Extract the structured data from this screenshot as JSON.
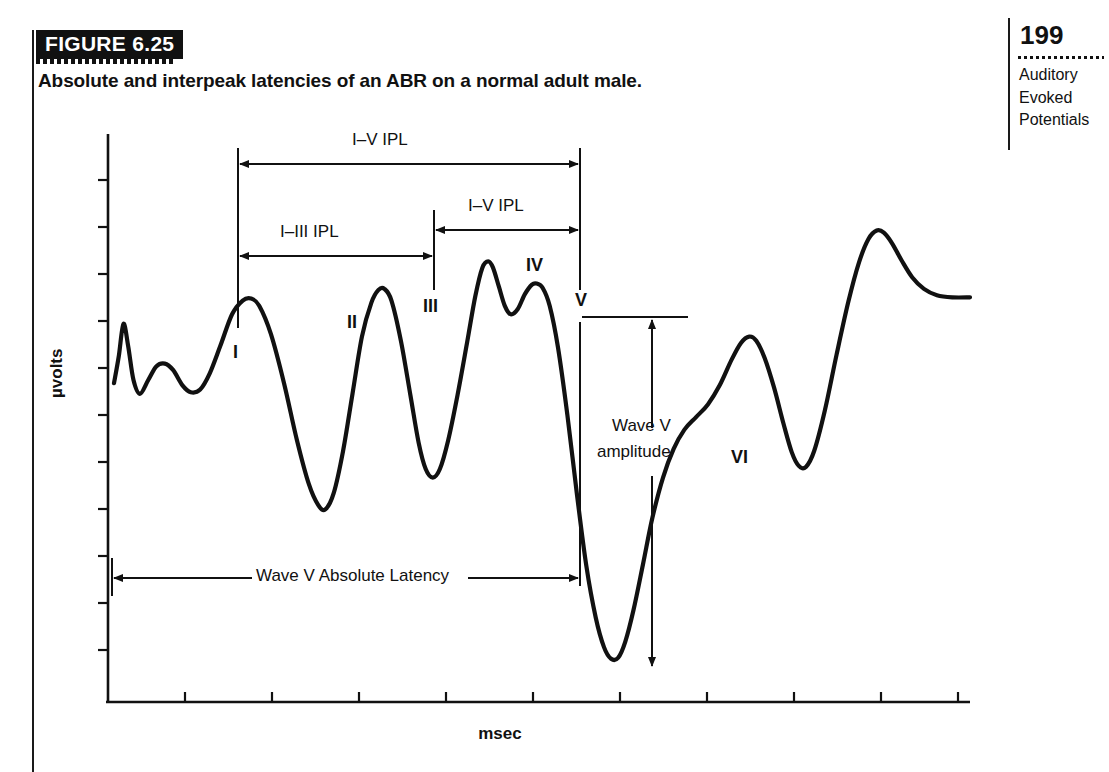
{
  "figure": {
    "tag": "FIGURE 6.25",
    "caption": "Absolute and interpeak latencies of an ABR on a normal adult male."
  },
  "margin": {
    "page_number": "199",
    "running_head_lines": [
      "Auditory",
      "Evoked",
      "Potentials"
    ]
  },
  "chart_data": {
    "type": "line",
    "title": "Absolute and interpeak latencies of an ABR on a normal adult male.",
    "xlabel": "msec",
    "ylabel": "µvolts",
    "grid": false,
    "legend": "none",
    "x_tick_count": 10,
    "x_tick_labels": [],
    "y_tick_count": 12,
    "y_tick_labels": [],
    "peak_labels": [
      "I",
      "II",
      "III",
      "IV",
      "V",
      "VI"
    ],
    "annotations": [
      {
        "id": "ipl-i-v-top",
        "label": "I–V IPL",
        "from_peak": "I",
        "to_peak": "V",
        "style": "double-arrow"
      },
      {
        "id": "ipl-iv-v",
        "label": "I–V IPL",
        "from_peak": "III",
        "to_peak": "V",
        "style": "double-arrow"
      },
      {
        "id": "ipl-i-iii",
        "label": "I–III IPL",
        "from_peak": "I",
        "to_peak": "III",
        "style": "double-arrow"
      },
      {
        "id": "wave-v-amplitude",
        "label_line1": "Wave V",
        "label_line2": "amplitude",
        "style": "vertical-double-arrow"
      },
      {
        "id": "wave-v-absolute-latency",
        "label": "Wave V Absolute Latency",
        "style": "double-arrow-with-inline-label"
      }
    ],
    "series": [
      {
        "name": "ABR waveform",
        "comment": "normalized trace: x in 0..1 across plotting area, y in 0..1 where 1 = top of plot",
        "points": [
          [
            0.0,
            0.56
          ],
          [
            0.008,
            0.61
          ],
          [
            0.016,
            0.672
          ],
          [
            0.024,
            0.63
          ],
          [
            0.033,
            0.566
          ],
          [
            0.044,
            0.54
          ],
          [
            0.058,
            0.566
          ],
          [
            0.072,
            0.592
          ],
          [
            0.086,
            0.597
          ],
          [
            0.1,
            0.585
          ],
          [
            0.116,
            0.556
          ],
          [
            0.13,
            0.543
          ],
          [
            0.146,
            0.548
          ],
          [
            0.162,
            0.578
          ],
          [
            0.18,
            0.63
          ],
          [
            0.2,
            0.69
          ],
          [
            0.218,
            0.716
          ],
          [
            0.232,
            0.72
          ],
          [
            0.246,
            0.706
          ],
          [
            0.266,
            0.652
          ],
          [
            0.288,
            0.56
          ],
          [
            0.31,
            0.452
          ],
          [
            0.33,
            0.37
          ],
          [
            0.346,
            0.33
          ],
          [
            0.358,
            0.322
          ],
          [
            0.372,
            0.352
          ],
          [
            0.388,
            0.432
          ],
          [
            0.404,
            0.54
          ],
          [
            0.42,
            0.648
          ],
          [
            0.436,
            0.712
          ],
          [
            0.448,
            0.736
          ],
          [
            0.458,
            0.738
          ],
          [
            0.47,
            0.716
          ],
          [
            0.486,
            0.64
          ],
          [
            0.502,
            0.538
          ],
          [
            0.516,
            0.448
          ],
          [
            0.528,
            0.398
          ],
          [
            0.54,
            0.382
          ],
          [
            0.552,
            0.398
          ],
          [
            0.566,
            0.452
          ],
          [
            0.582,
            0.538
          ],
          [
            0.598,
            0.636
          ],
          [
            0.612,
            0.724
          ],
          [
            0.624,
            0.778
          ],
          [
            0.634,
            0.79
          ],
          [
            0.642,
            0.778
          ],
          [
            0.652,
            0.742
          ],
          [
            0.662,
            0.706
          ],
          [
            0.672,
            0.69
          ],
          [
            0.684,
            0.7
          ],
          [
            0.696,
            0.728
          ],
          [
            0.708,
            0.746
          ],
          [
            0.716,
            0.748
          ],
          [
            0.726,
            0.74
          ],
          [
            0.738,
            0.706
          ],
          [
            0.752,
            0.628
          ],
          [
            0.768,
            0.5
          ],
          [
            0.784,
            0.352
          ],
          [
            0.8,
            0.216
          ],
          [
            0.816,
            0.118
          ],
          [
            0.83,
            0.062
          ],
          [
            0.842,
            0.04
          ],
          [
            0.854,
            0.042
          ],
          [
            0.866,
            0.072
          ],
          [
            0.88,
            0.132
          ],
          [
            0.896,
            0.218
          ],
          [
            0.912,
            0.306
          ],
          [
            0.93,
            0.382
          ],
          [
            0.948,
            0.436
          ],
          [
            0.966,
            0.472
          ],
          [
            0.986,
            0.496
          ],
          [
            1.006,
            0.52
          ],
          [
            1.026,
            0.556
          ],
          [
            1.046,
            0.604
          ],
          [
            1.062,
            0.636
          ],
          [
            1.076,
            0.648
          ],
          [
            1.088,
            0.64
          ],
          [
            1.102,
            0.608
          ],
          [
            1.118,
            0.552
          ],
          [
            1.134,
            0.484
          ],
          [
            1.148,
            0.43
          ],
          [
            1.16,
            0.404
          ],
          [
            1.172,
            0.402
          ],
          [
            1.186,
            0.432
          ],
          [
            1.204,
            0.508
          ],
          [
            1.224,
            0.614
          ],
          [
            1.244,
            0.714
          ],
          [
            1.262,
            0.788
          ],
          [
            1.278,
            0.832
          ],
          [
            1.292,
            0.848
          ],
          [
            1.304,
            0.844
          ],
          [
            1.318,
            0.824
          ],
          [
            1.334,
            0.792
          ],
          [
            1.352,
            0.76
          ],
          [
            1.372,
            0.738
          ],
          [
            1.394,
            0.726
          ],
          [
            1.42,
            0.722
          ],
          [
            1.45,
            0.722
          ]
        ]
      }
    ]
  }
}
